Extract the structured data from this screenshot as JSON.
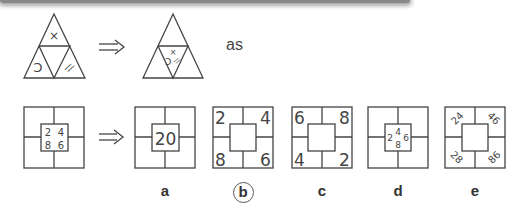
{
  "header_bar": {
    "color": "#888888"
  },
  "example": {
    "source_triangle": {
      "top_symbol": "×",
      "left_symbol": "C",
      "right_symbol": "//"
    },
    "arrow": "⇒",
    "target_triangle": {
      "center_symbols": [
        "×",
        "C",
        "//"
      ]
    },
    "relation_word": "as"
  },
  "question": {
    "source_square": {
      "center_numbers": [
        "2",
        "4",
        "8",
        "6"
      ]
    },
    "arrow": "⇒",
    "options": [
      {
        "label": "a",
        "selected": false,
        "center": "20"
      },
      {
        "label": "b",
        "selected": true,
        "corners": [
          "2",
          "4",
          "8",
          "6"
        ]
      },
      {
        "label": "c",
        "selected": false,
        "corners": [
          "6",
          "8",
          "4",
          "2"
        ]
      },
      {
        "label": "d",
        "selected": false,
        "center_numbers": [
          "4",
          "2",
          "6",
          "8"
        ]
      },
      {
        "label": "e",
        "selected": false,
        "corners": [
          "24",
          "46",
          "28",
          "86"
        ]
      }
    ]
  },
  "colors": {
    "line": "#444444",
    "text": "#444444",
    "background": "#ffffff"
  }
}
